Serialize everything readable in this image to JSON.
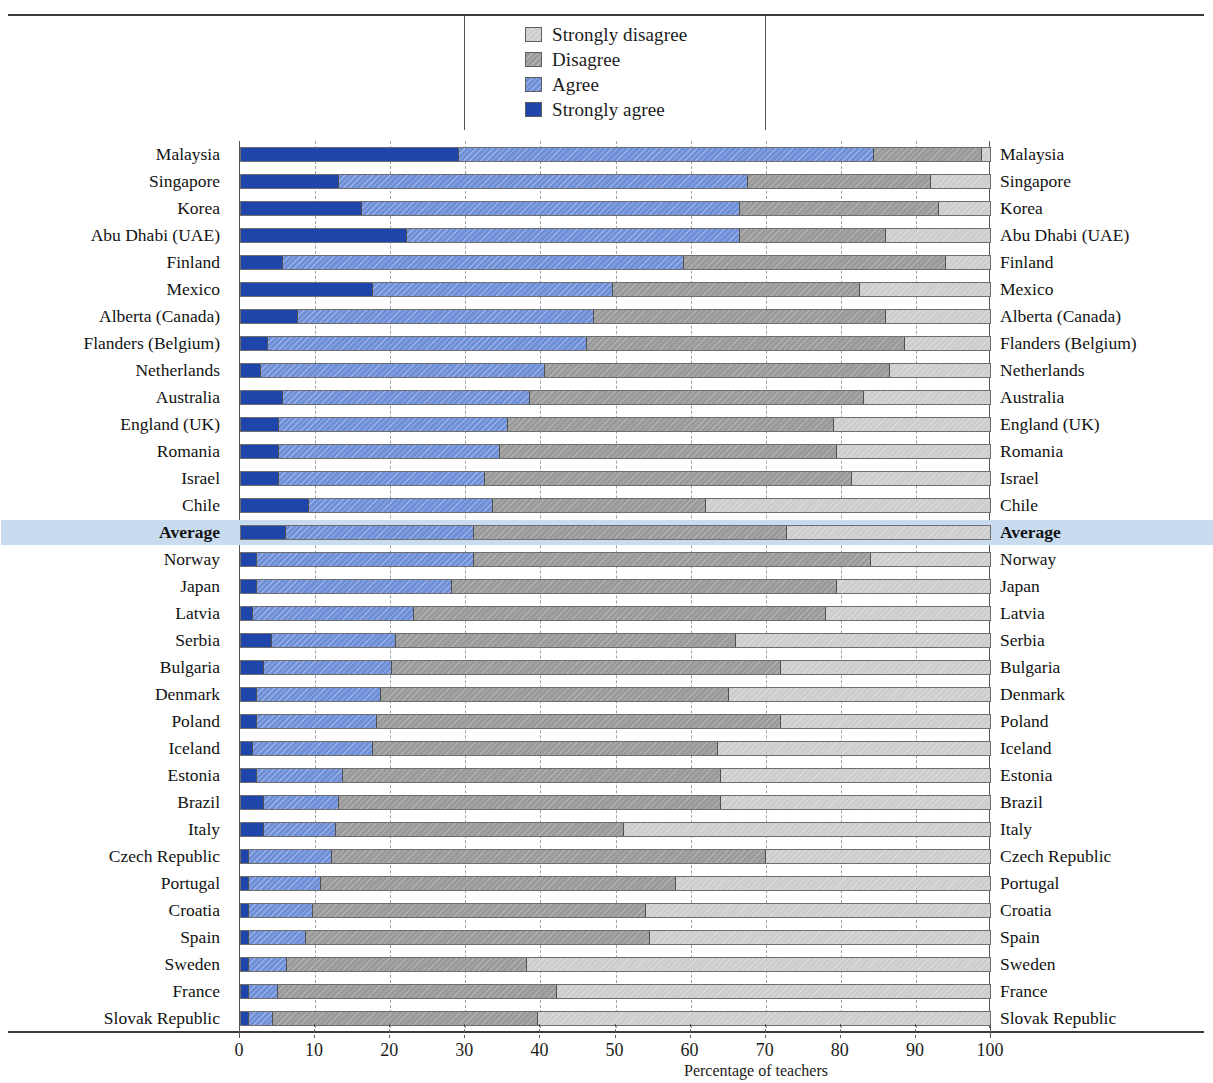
{
  "figure": {
    "partial_top_title": "",
    "xaxis_title": "Percentage of teachers",
    "xticks": [
      0,
      10,
      20,
      30,
      40,
      50,
      60,
      70,
      80,
      90,
      100
    ]
  },
  "legend": {
    "items": [
      {
        "label": "Strongly disagree",
        "color": "#cdcdcd",
        "key": "strongly_disagree"
      },
      {
        "label": "Disagree",
        "color": "#9a9a9a",
        "key": "disagree"
      },
      {
        "label": "Agree",
        "color": "#6f8fd8",
        "key": "agree"
      },
      {
        "label": "Strongly agree",
        "color": "#1f45aa",
        "key": "strongly_agree"
      }
    ]
  },
  "colors": {
    "strongly_agree": "#1f45aa",
    "agree": "#6f8fd8",
    "disagree": "#9a9a9a",
    "strongly_disagree": "#cdcdcd",
    "highlight_row": "#c9dbef",
    "axis": "#3a3a3a",
    "gridline": "#9aa2b0"
  },
  "chart_data": {
    "type": "bar",
    "orientation": "horizontal",
    "stacked": true,
    "percent_stacked": true,
    "title": "",
    "xlabel": "Percentage of teachers",
    "ylabel": "",
    "xlim": [
      0,
      100
    ],
    "xticks": [
      0,
      10,
      20,
      30,
      40,
      50,
      60,
      70,
      80,
      90,
      100
    ],
    "grid": "vertical-dashed",
    "legend_position": "top-center",
    "series_order": [
      "Strongly agree",
      "Agree",
      "Disagree",
      "Strongly disagree"
    ],
    "series": [
      {
        "name": "Strongly agree",
        "color": "#1f45aa",
        "values": [
          29.0,
          13.0,
          16.0,
          22.0,
          5.5,
          17.5,
          7.5,
          3.5,
          2.5,
          5.5,
          5.0,
          5.0,
          5.0,
          9.0,
          5.9,
          2.0,
          2.0,
          1.5,
          4.0,
          3.0,
          2.0,
          2.0,
          1.5,
          2.0,
          3.0,
          3.0,
          1.0,
          1.0,
          1.0,
          1.0,
          1.0,
          1.0,
          1.0
        ]
      },
      {
        "name": "Agree",
        "color": "#6f8fd8",
        "values": [
          55.4,
          54.5,
          50.5,
          44.5,
          53.5,
          32.0,
          39.5,
          42.5,
          38.0,
          33.0,
          30.5,
          29.5,
          27.5,
          24.5,
          25.1,
          29.0,
          26.0,
          21.5,
          16.5,
          17.0,
          16.5,
          16.0,
          16.0,
          11.5,
          10.0,
          9.5,
          11.0,
          9.5,
          8.5,
          7.5,
          5.0,
          3.8,
          3.1
        ]
      },
      {
        "name": "Disagree",
        "color": "#9a9a9a",
        "values": [
          14.4,
          24.5,
          26.5,
          19.5,
          35.0,
          33.0,
          39.0,
          42.5,
          46.0,
          44.5,
          43.5,
          45.0,
          49.0,
          28.5,
          41.8,
          53.0,
          51.5,
          55.0,
          45.5,
          52.0,
          46.5,
          54.0,
          46.0,
          50.5,
          51.0,
          38.5,
          58.0,
          47.5,
          44.5,
          46.0,
          32.0,
          37.2,
          35.4
        ]
      },
      {
        "name": "Strongly disagree",
        "color": "#cdcdcd",
        "values": [
          1.2,
          8.0,
          7.0,
          14.0,
          6.0,
          17.5,
          14.0,
          11.5,
          13.5,
          17.0,
          21.0,
          20.5,
          18.5,
          38.0,
          27.2,
          16.0,
          20.5,
          22.0,
          34.0,
          28.0,
          35.0,
          28.0,
          36.5,
          36.0,
          36.0,
          49.0,
          30.0,
          42.0,
          46.0,
          45.5,
          62.0,
          58.0,
          60.5
        ]
      }
    ],
    "categories": [
      "Malaysia",
      "Singapore",
      "Korea",
      "Abu Dhabi (UAE)",
      "Finland",
      "Mexico",
      "Alberta (Canada)",
      "Flanders (Belgium)",
      "Netherlands",
      "Australia",
      "England (UK)",
      "Romania",
      "Israel",
      "Chile",
      "Average",
      "Norway",
      "Japan",
      "Latvia",
      "Serbia",
      "Bulgaria",
      "Denmark",
      "Poland",
      "Iceland",
      "Estonia",
      "Brazil",
      "Italy",
      "Czech Republic",
      "Portugal",
      "Croatia",
      "Spain",
      "Sweden",
      "France",
      "Slovak Republic"
    ],
    "highlighted_category": "Average"
  }
}
